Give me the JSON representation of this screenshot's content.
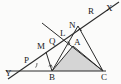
{
  "figure": {
    "canvas": {
      "width": 121,
      "height": 84
    },
    "background_color": "#fbfbfa",
    "stroke_color": "#2b2b2b",
    "shaded_region_color": "#d5d5d5",
    "shaded_region_label": "triangle-BAC"
  },
  "labels": [
    {
      "id": "X",
      "text": "X",
      "x": 106,
      "y": 4,
      "name": "point-label-X"
    },
    {
      "id": "R",
      "text": "R",
      "x": 88,
      "y": 7,
      "name": "point-label-R"
    },
    {
      "id": "N",
      "text": "N",
      "x": 69,
      "y": 21,
      "name": "point-label-N"
    },
    {
      "id": "L",
      "text": "L",
      "x": 60,
      "y": 29,
      "name": "point-label-L"
    },
    {
      "id": "Q",
      "text": "Q",
      "x": 49,
      "y": 37,
      "name": "point-label-Q"
    },
    {
      "id": "A",
      "text": "A",
      "x": 74,
      "y": 38,
      "name": "point-label-A"
    },
    {
      "id": "M",
      "text": "M",
      "x": 37,
      "y": 42,
      "name": "point-label-M"
    },
    {
      "id": "P",
      "text": "P",
      "x": 24,
      "y": 56,
      "name": "point-label-P"
    },
    {
      "id": "Y",
      "text": "Y",
      "x": 5,
      "y": 69,
      "name": "point-label-Y"
    },
    {
      "id": "B",
      "text": "B",
      "x": 49,
      "y": 73,
      "name": "point-label-B"
    },
    {
      "id": "C",
      "text": "C",
      "x": 101,
      "y": 73,
      "name": "point-label-C"
    }
  ],
  "points": {
    "X": {
      "x": 113,
      "y": 5
    },
    "R": {
      "x": 95,
      "y": 16
    },
    "N": {
      "x": 76,
      "y": 29
    },
    "L": {
      "x": 67,
      "y": 36
    },
    "Q": {
      "x": 57,
      "y": 43
    },
    "A": {
      "x": 73,
      "y": 46
    },
    "M": {
      "x": 47,
      "y": 51
    },
    "P": {
      "x": 31,
      "y": 63
    },
    "Y": {
      "x": 12,
      "y": 76
    },
    "B": {
      "x": 52,
      "y": 71
    },
    "C": {
      "x": 103,
      "y": 71
    },
    "T": {
      "x": 42,
      "y": 23
    }
  },
  "segments": [
    {
      "name": "ray-YX-baseline-oblique",
      "from": "Y",
      "to": "X"
    },
    {
      "name": "line-BC-base",
      "from": "B",
      "to": "C"
    },
    {
      "name": "segment-B-A",
      "from": "B",
      "to": "A"
    },
    {
      "name": "segment-A-C",
      "from": "A",
      "to": "C"
    },
    {
      "name": "segment-B-N",
      "from": "B",
      "to": "N"
    },
    {
      "name": "segment-N-C",
      "from": "N",
      "to": "C"
    },
    {
      "name": "segment-B-M-perp",
      "from": "B",
      "to": "M"
    },
    {
      "name": "segment-T-Q-A-C",
      "from": "T",
      "to": "C"
    }
  ],
  "right_angle_marks": [
    {
      "name": "right-angle-at-N",
      "x": 76,
      "y": 29
    },
    {
      "name": "right-angle-at-A",
      "x": 70,
      "y": 43
    },
    {
      "name": "right-angle-near-B",
      "x": 52,
      "y": 71
    }
  ],
  "axis_extension_line": {
    "name": "horizontal-axis-Y-to-C",
    "from_x": 6,
    "from_y": 71,
    "to_x": 105,
    "to_y": 71
  }
}
